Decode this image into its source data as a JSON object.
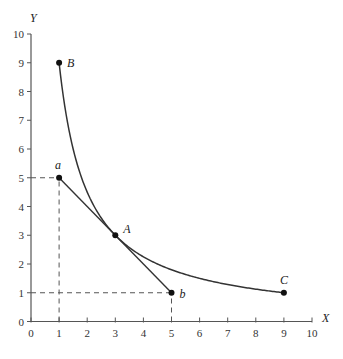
{
  "chart_data": {
    "type": "line",
    "title": "",
    "xlabel": "X",
    "ylabel": "Y",
    "xlim": [
      0,
      10
    ],
    "ylim": [
      0,
      10
    ],
    "x_ticks": [
      "0",
      "1",
      "2",
      "3",
      "4",
      "5",
      "6",
      "7",
      "8",
      "9",
      "10"
    ],
    "y_ticks": [
      "0",
      "1",
      "2",
      "3",
      "4",
      "5",
      "6",
      "7",
      "8",
      "9",
      "10"
    ],
    "grid": false,
    "series": [
      {
        "name": "indifference-curve",
        "kind": "curve",
        "equation": "x*y=9",
        "x": [
          1,
          1.5,
          2,
          3,
          4,
          5,
          6,
          7,
          8,
          9
        ],
        "y": [
          9,
          6,
          4.5,
          3,
          2.25,
          1.8,
          1.5,
          1.2857,
          1.125,
          1
        ]
      },
      {
        "name": "budget-line",
        "kind": "line",
        "x": [
          1,
          5
        ],
        "y": [
          5,
          1
        ]
      }
    ],
    "points": [
      {
        "label": "B",
        "x": 1,
        "y": 9
      },
      {
        "label": "a",
        "x": 1,
        "y": 5
      },
      {
        "label": "A",
        "x": 3,
        "y": 3
      },
      {
        "label": "b",
        "x": 5,
        "y": 1
      },
      {
        "label": "C",
        "x": 9,
        "y": 1
      }
    ],
    "guides": [
      {
        "from": [
          0,
          5
        ],
        "to": [
          1,
          5
        ],
        "style": "dashed"
      },
      {
        "from": [
          1,
          0
        ],
        "to": [
          1,
          5
        ],
        "style": "dashed"
      },
      {
        "from": [
          0,
          1
        ],
        "to": [
          5,
          1
        ],
        "style": "dashed"
      },
      {
        "from": [
          5,
          0
        ],
        "to": [
          5,
          1
        ],
        "style": "dashed"
      }
    ]
  }
}
